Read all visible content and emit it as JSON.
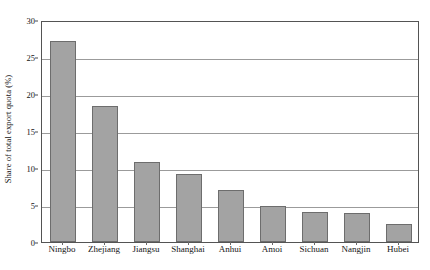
{
  "chart_data": {
    "type": "bar",
    "title": "",
    "xlabel": "",
    "ylabel": "Share of total export quota (%)",
    "categories": [
      "Ningbo",
      "Zhejiang",
      "Jiangsu",
      "Shanghai",
      "Anhui",
      "Amoi",
      "Sichuan",
      "Nangjin",
      "Hubei"
    ],
    "values": [
      27.2,
      18.4,
      10.8,
      9.2,
      7.0,
      4.8,
      4.0,
      3.9,
      2.4
    ],
    "ylim": [
      0,
      30
    ],
    "yticks": [
      0,
      5,
      10,
      15,
      20,
      25,
      30
    ],
    "ytick_labels": [
      "0",
      "5",
      "10",
      "15",
      "20",
      "25",
      "30"
    ],
    "grid": true,
    "grid_axis": "y",
    "legend": false,
    "legend_position": "none",
    "bar_fill_color": "#a3a3a3",
    "bar_edge_color": "#6d6d6d",
    "gridline_color": "#9b9b9b",
    "frame_color": "#545454",
    "background_color": "#ffffff"
  }
}
